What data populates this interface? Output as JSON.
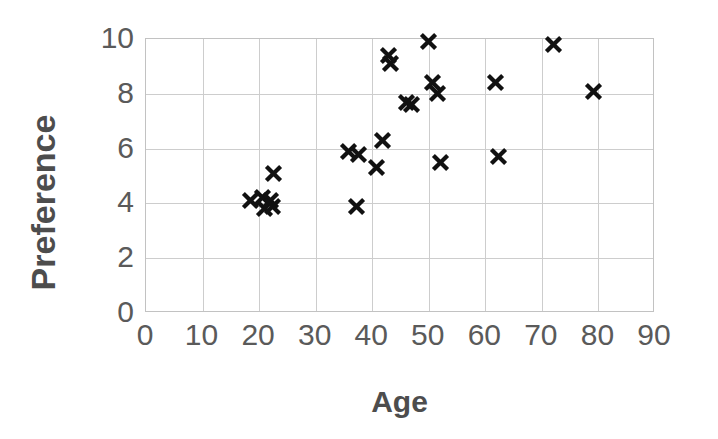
{
  "chart_data": {
    "type": "scatter",
    "title": "",
    "xlabel": "Age",
    "ylabel": "Preference",
    "xlim": [
      0,
      90
    ],
    "ylim": [
      0,
      10
    ],
    "xticks": [
      0,
      10,
      20,
      30,
      40,
      50,
      60,
      70,
      80,
      90
    ],
    "yticks": [
      0,
      2,
      4,
      6,
      8,
      10
    ],
    "xtick_labels": [
      "0",
      "10",
      "20",
      "30",
      "40",
      "50",
      "60",
      "70",
      "80",
      "90"
    ],
    "ytick_labels": [
      "0",
      "2",
      "4",
      "6",
      "8",
      "10"
    ],
    "grid": true,
    "legend": "none",
    "marker": "x-cross",
    "marker_color": "#111111",
    "grid_color": "#cdcdcd",
    "axis_color": "#c2c2c2",
    "label_color": "#4d4d4d",
    "tick_color": "#5a5a5a",
    "series": [
      {
        "name": "Age vs Preference",
        "points": [
          {
            "x": 18.4,
            "y": 4.1
          },
          {
            "x": 20.6,
            "y": 4.2
          },
          {
            "x": 21.0,
            "y": 3.8
          },
          {
            "x": 22.0,
            "y": 4.1
          },
          {
            "x": 22.4,
            "y": 3.9
          },
          {
            "x": 22.6,
            "y": 5.1
          },
          {
            "x": 35.8,
            "y": 5.9
          },
          {
            "x": 37.3,
            "y": 3.9
          },
          {
            "x": 37.6,
            "y": 5.8
          },
          {
            "x": 40.8,
            "y": 5.3
          },
          {
            "x": 41.8,
            "y": 6.3
          },
          {
            "x": 42.9,
            "y": 9.4
          },
          {
            "x": 43.2,
            "y": 9.1
          },
          {
            "x": 46.1,
            "y": 7.7
          },
          {
            "x": 47.0,
            "y": 7.6
          },
          {
            "x": 49.9,
            "y": 9.9
          },
          {
            "x": 50.6,
            "y": 8.4
          },
          {
            "x": 51.5,
            "y": 8.0
          },
          {
            "x": 52.0,
            "y": 5.5
          },
          {
            "x": 61.8,
            "y": 8.4
          },
          {
            "x": 62.4,
            "y": 5.7
          },
          {
            "x": 72.0,
            "y": 9.8
          },
          {
            "x": 79.2,
            "y": 8.1
          }
        ]
      }
    ]
  }
}
